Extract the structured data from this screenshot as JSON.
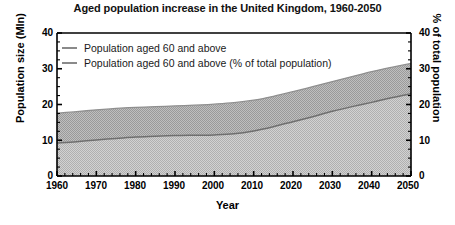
{
  "chart_data": {
    "type": "area",
    "title": "Aged population increase in the United Kingdom, 1960-2050",
    "xlabel": "Year",
    "ylabel": "Population size (Mln)",
    "y2label": "% of total population",
    "xlim": [
      1960,
      2050
    ],
    "ylim": [
      0,
      40
    ],
    "y2lim": [
      0,
      40
    ],
    "xticks": [
      "1960",
      "1970",
      "1980",
      "1990",
      "2000",
      "2010",
      "2020",
      "2030",
      "2040",
      "2050"
    ],
    "yticks": [
      "0",
      "10",
      "20",
      "30",
      "40"
    ],
    "y2ticks": [
      "0",
      "10",
      "20",
      "30",
      "40"
    ],
    "grid": false,
    "legend_position": "upper-left",
    "x": [
      1960,
      1965,
      1970,
      1975,
      1980,
      1985,
      1990,
      1995,
      2000,
      2005,
      2010,
      2015,
      2020,
      2025,
      2030,
      2035,
      2040,
      2045,
      2050
    ],
    "series": [
      {
        "name": "Population aged 60 and above",
        "unit": "Mln",
        "axis": "left",
        "values": [
          9.2,
          9.6,
          10.1,
          10.5,
          10.9,
          11.1,
          11.3,
          11.4,
          11.5,
          11.8,
          12.6,
          13.8,
          15.2,
          16.6,
          18.1,
          19.4,
          20.6,
          21.9,
          23.0
        ]
      },
      {
        "name": "Population aged 60 and above (% of total population)",
        "unit": "%",
        "axis": "right",
        "values": [
          17.6,
          18.0,
          18.5,
          18.9,
          19.2,
          19.4,
          19.6,
          19.8,
          20.1,
          20.5,
          21.2,
          22.3,
          23.6,
          25.0,
          26.4,
          27.8,
          29.2,
          30.4,
          31.5
        ]
      }
    ],
    "colors": {
      "axis": "#000000",
      "line": "#6b6b6b",
      "band_upper_fill": "#b4b4b4",
      "band_lower_fill": "#c9c9c9",
      "background": "#ffffff"
    }
  },
  "legend": {
    "items": [
      {
        "label": "Population aged 60 and above"
      },
      {
        "label": "Population aged 60 and above (% of total population)"
      }
    ]
  }
}
